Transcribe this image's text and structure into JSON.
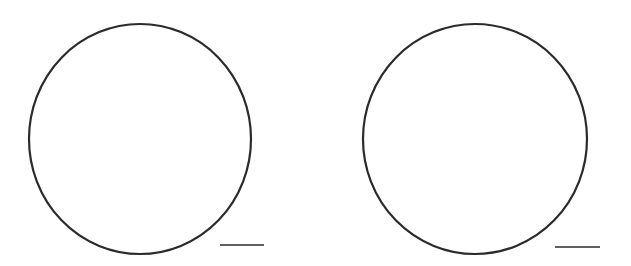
{
  "figure": {
    "background": "#ffffff",
    "stroke_color": "#2b2b2b",
    "panels": [
      {
        "name": "left",
        "circle": {
          "cx": 140,
          "cy": 139,
          "rx": 111,
          "ry": 115,
          "stroke_width": 2.2
        },
        "scale_bar": {
          "x1": 220,
          "x2": 264,
          "y": 245,
          "stroke_width": 1.6
        }
      },
      {
        "name": "right",
        "circle": {
          "cx": 475,
          "cy": 139,
          "rx": 112,
          "ry": 115,
          "stroke_width": 2.2
        },
        "scale_bar": {
          "x1": 555,
          "x2": 600,
          "y": 247,
          "stroke_width": 1.6
        }
      }
    ]
  }
}
